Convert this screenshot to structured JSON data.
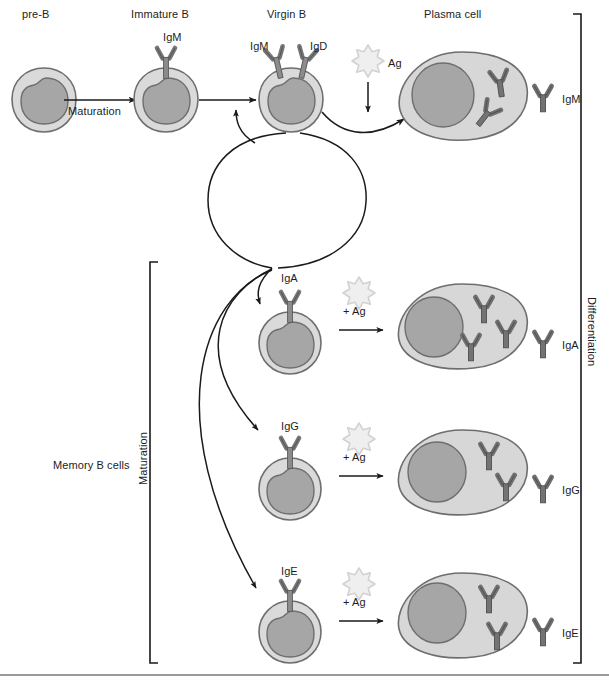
{
  "figure": {
    "colors": {
      "cytoplasm": "#d9d9d9",
      "cytoplasm_stroke": "#6e6e6e",
      "nucleus": "#a6a6a6",
      "nucleus_stroke": "#6e6e6e",
      "antibody": "#6b6b6b",
      "antibody_stroke": "#4a4a4a",
      "antigen": "#ececec",
      "antigen_stroke": "#cfcfcf",
      "line": "#1a1a1a",
      "bottom_rule": "#9a9a9a"
    }
  },
  "stage_labels": [
    {
      "id": "pre-b",
      "text": "pre-B",
      "x": 22,
      "y": 8
    },
    {
      "id": "immature-b",
      "text": "Immature B",
      "x": 131,
      "y": 8
    },
    {
      "id": "virgin-b",
      "text": "Virgin B",
      "x": 267,
      "y": 8
    },
    {
      "id": "plasma-cell",
      "text": "Plasma cell",
      "x": 424,
      "y": 8
    }
  ],
  "process_labels": [
    {
      "id": "maturation-arrow-label",
      "text": "Maturation",
      "x": 68,
      "y": 105
    },
    {
      "id": "memory-b-cells",
      "text": "Memory B cells",
      "x": 53,
      "y": 459
    }
  ],
  "vertical_labels": [
    {
      "id": "maturation-bracket-label",
      "text": "Maturation",
      "x": 144,
      "y": 432,
      "direction": "up"
    },
    {
      "id": "differentiation-bracket-label",
      "text": "Differentiation",
      "x": 592,
      "y": 297,
      "direction": "down"
    }
  ],
  "receptor_labels": [
    {
      "id": "igm-immature",
      "text": "IgM",
      "x": 163,
      "y": 31
    },
    {
      "id": "igm-virgin",
      "text": "IgM",
      "x": 250,
      "y": 40
    },
    {
      "id": "igd-virgin",
      "text": "IgD",
      "x": 310,
      "y": 40
    },
    {
      "id": "iga-memory",
      "text": "IgA",
      "x": 281,
      "y": 272
    },
    {
      "id": "igg-memory",
      "text": "IgG",
      "x": 281,
      "y": 420
    },
    {
      "id": "ige-memory",
      "text": "IgE",
      "x": 281,
      "y": 565
    }
  ],
  "antigen_labels": [
    {
      "id": "ag-top",
      "text": "Ag",
      "x": 388,
      "y": 57
    },
    {
      "id": "ag-iga",
      "text": "+ Ag",
      "x": 343,
      "y": 313
    },
    {
      "id": "ag-igg",
      "text": "+ Ag",
      "x": 343,
      "y": 459
    },
    {
      "id": "ag-ige",
      "text": "+ Ag",
      "x": 343,
      "y": 604
    }
  ],
  "secreted_labels": [
    {
      "id": "secreted-igm",
      "text": "IgM",
      "x": 562,
      "y": 98
    },
    {
      "id": "secreted-iga",
      "text": "IgA",
      "x": 562,
      "y": 344
    },
    {
      "id": "secreted-igg",
      "text": "IgG",
      "x": 562,
      "y": 489
    },
    {
      "id": "secreted-ige",
      "text": "IgE",
      "x": 562,
      "y": 632
    }
  ],
  "cells": {
    "pre_b": {
      "name": "pre-B cell",
      "cx": 44,
      "cy": 100
    },
    "immature_b": {
      "name": "Immature B cell",
      "cx": 166,
      "cy": 100
    },
    "virgin_b": {
      "name": "Virgin B cell",
      "cx": 291,
      "cy": 100
    },
    "memory_iga": {
      "name": "IgA memory B cell",
      "cx": 290,
      "cy": 343
    },
    "memory_igg": {
      "name": "IgG memory B cell",
      "cx": 290,
      "cy": 489
    },
    "memory_ige": {
      "name": "IgE memory B cell",
      "cx": 290,
      "cy": 632
    },
    "plasma_igm": {
      "name": "IgM plasma cell",
      "cx": 462,
      "cy": 101,
      "antibody_count": 2
    },
    "plasma_iga": {
      "name": "IgA plasma cell",
      "cx": 462,
      "cy": 330,
      "antibody_count": 3
    },
    "plasma_igg": {
      "name": "IgG plasma cell",
      "cx": 462,
      "cy": 476,
      "antibody_count": 2
    },
    "plasma_ige": {
      "name": "IgE plasma cell",
      "cx": 462,
      "cy": 620,
      "antibody_count": 2
    }
  }
}
